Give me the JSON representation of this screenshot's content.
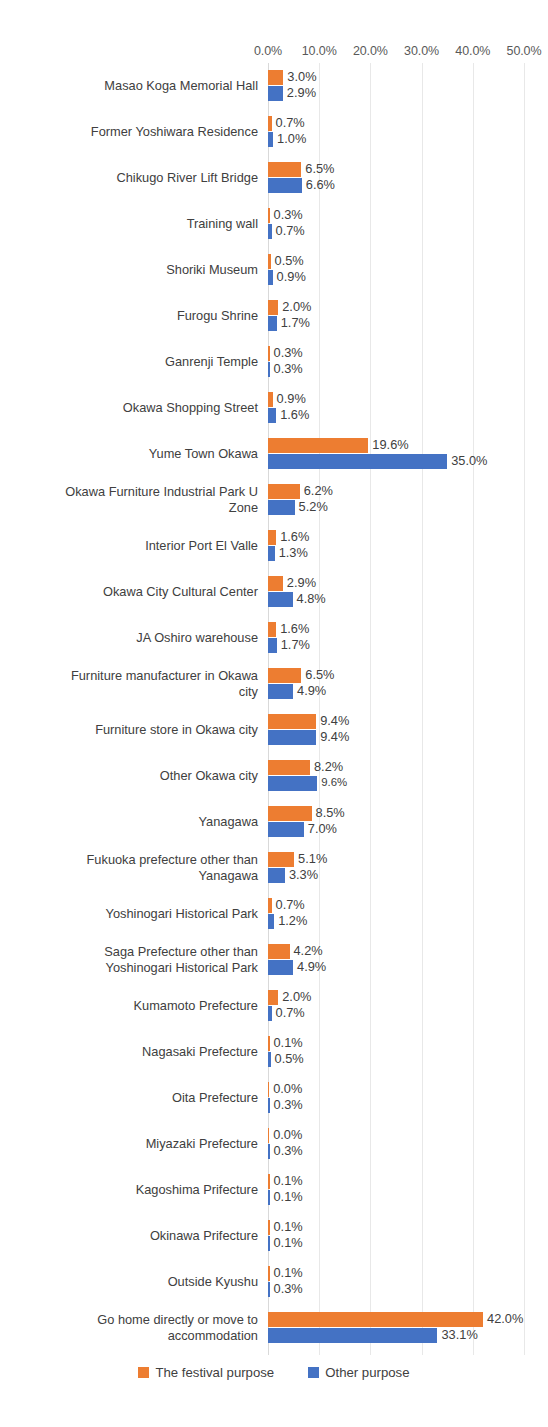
{
  "chart_data": {
    "type": "bar",
    "orientation": "horizontal",
    "title": "",
    "xlabel": "",
    "ylabel": "",
    "xlim": [
      0,
      50
    ],
    "xticks": [
      "0.0%",
      "10.0%",
      "20.0%",
      "30.0%",
      "40.0%",
      "50.0%"
    ],
    "xtick_values": [
      0,
      10,
      20,
      30,
      40,
      50
    ],
    "grid": true,
    "legend_position": "bottom",
    "colors": {
      "series_0": "#ED7D31",
      "series_1": "#4472C4",
      "gridline": "#E8E8E8",
      "text": "#404040",
      "tick_text": "#595959"
    },
    "categories": [
      "Masao Koga Memorial Hall",
      "Former Yoshiwara Residence",
      "Chikugo River Lift Bridge",
      "Training wall",
      "Shoriki Museum",
      "Furogu Shrine",
      "Ganrenji Temple",
      "Okawa Shopping Street",
      "Yume Town Okawa",
      "Okawa Furniture Industrial Park U\nZone",
      "Interior Port El Valle",
      "Okawa City Cultural Center",
      "JA Oshiro warehouse",
      "Furniture manufacturer in Okawa\ncity",
      "Furniture store in Okawa city",
      "Other Okawa city",
      "Yanagawa",
      "Fukuoka prefecture other than\nYanagawa",
      "Yoshinogari Historical Park",
      "Saga Prefecture other than\nYoshinogari Historical Park",
      "Kumamoto Prefecture",
      "Nagasaki Prefecture",
      "Oita Prefecture",
      "Miyazaki Prefecture",
      "Kagoshima Prifecture",
      "Okinawa Prifecture",
      "Outside Kyushu",
      "Go home directly or move to\naccommodation"
    ],
    "series": [
      {
        "name": "The festival purpose",
        "color": "#ED7D31",
        "values": [
          3.0,
          0.7,
          6.5,
          0.3,
          0.5,
          2.0,
          0.3,
          0.9,
          19.6,
          6.2,
          1.6,
          2.9,
          1.6,
          6.5,
          9.4,
          8.2,
          8.5,
          5.1,
          0.7,
          4.2,
          2.0,
          0.1,
          0.0,
          0.0,
          0.1,
          0.1,
          0.1,
          42.0
        ],
        "labels": [
          "3.0%",
          "0.7%",
          "6.5%",
          "0.3%",
          "0.5%",
          "2.0%",
          "0.3%",
          "0.9%",
          "19.6%",
          "6.2%",
          "1.6%",
          "2.9%",
          "1.6%",
          "6.5%",
          "9.4%",
          "8.2%",
          "8.5%",
          "5.1%",
          "0.7%",
          "4.2%",
          "2.0%",
          "0.1%",
          "0.0%",
          "0.0%",
          "0.1%",
          "0.1%",
          "0.1%",
          "42.0%"
        ]
      },
      {
        "name": "Other purpose",
        "color": "#4472C4",
        "values": [
          2.9,
          1.0,
          6.6,
          0.7,
          0.9,
          1.7,
          0.3,
          1.6,
          35.0,
          5.2,
          1.3,
          4.8,
          1.7,
          4.9,
          9.4,
          9.6,
          7.0,
          3.3,
          1.2,
          4.9,
          0.7,
          0.5,
          0.3,
          0.3,
          0.1,
          0.1,
          0.3,
          33.1
        ],
        "labels": [
          "2.9%",
          "1.0%",
          "6.6%",
          "0.7%",
          "0.9%",
          "1.7%",
          "0.3%",
          "1.6%",
          "35.0%",
          "5.2%",
          "1.3%",
          "4.8%",
          "1.7%",
          "4.9%",
          "9.4%",
          "9.6%",
          "7.0%",
          "3.3%",
          "1.2%",
          "4.9%",
          "0.7%",
          "0.5%",
          "0.3%",
          "0.3%",
          "0.1%",
          "0.1%",
          "0.3%",
          "33.1%"
        ]
      }
    ],
    "small_labels": [
      [
        1,
        15
      ]
    ]
  },
  "legend": {
    "items": [
      {
        "label": "The festival purpose",
        "color": "#ED7D31"
      },
      {
        "label": "Other purpose",
        "color": "#4472C4"
      }
    ]
  }
}
